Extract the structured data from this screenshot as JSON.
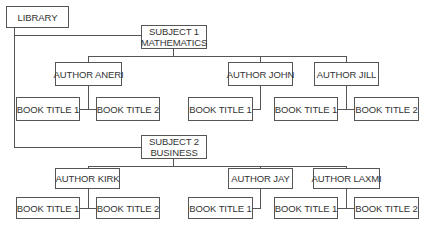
{
  "diagram": {
    "type": "hierarchy",
    "root": {
      "label": "LIBRARY"
    },
    "subjects": [
      {
        "line1": "SUBJECT 1",
        "line2": "MATHEMATICS",
        "authors": [
          {
            "label": "AUTHOR ANERI",
            "books": [
              "BOOK TITLE 1",
              "BOOK TITLE 2"
            ]
          },
          {
            "label": "AUTHOR JOHN",
            "books": [
              "BOOK TITLE 1"
            ]
          },
          {
            "label": "AUTHOR JILL",
            "books": [
              "BOOK TITLE 1",
              "BOOK TITLE 2"
            ]
          }
        ]
      },
      {
        "line1": "SUBJECT 2",
        "line2": "BUSINESS",
        "authors": [
          {
            "label": "AUTHOR KIRK",
            "books": [
              "BOOK TITLE 1",
              "BOOK TITLE 2"
            ]
          },
          {
            "label": "AUTHOR JAY",
            "books": [
              "BOOK TITLE 1"
            ]
          },
          {
            "label": "AUTHOR LAXMI",
            "books": [
              "BOOK TITLE 1",
              "BOOK TITLE 2"
            ]
          }
        ]
      }
    ],
    "colors": {
      "line": "#555555",
      "text": "#333333",
      "background": "#ffffff"
    }
  }
}
